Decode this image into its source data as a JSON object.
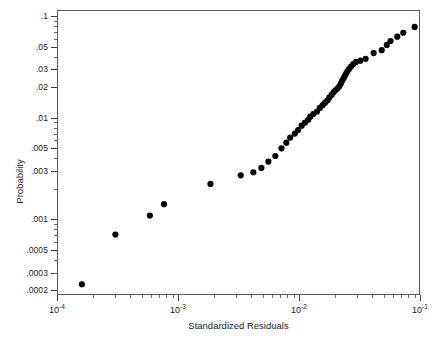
{
  "chart_data": {
    "type": "scatter",
    "title": "",
    "xlabel": "Standardized Residuals",
    "ylabel": "Probability",
    "xscale": "log",
    "yscale": "log",
    "xlim": [
      0.0001,
      0.1
    ],
    "ylim": [
      0.00018,
      0.115
    ],
    "grid": false,
    "legend": null,
    "marker": "filled-circle",
    "marker_color": "#000000",
    "x_tick_labels": [
      "10-4",
      "10-3",
      "10-2",
      "10-1"
    ],
    "x_tick_values": [
      0.0001,
      0.001,
      0.01,
      0.1
    ],
    "y_tick_labels": [
      ".1",
      ".05",
      ".03",
      ".02",
      ".01",
      ".005",
      ".003",
      ".001",
      ".0005",
      ".0003",
      ".0002"
    ],
    "y_tick_values": [
      0.1,
      0.05,
      0.03,
      0.02,
      0.01,
      0.005,
      0.003,
      0.001,
      0.0005,
      0.0003,
      0.0002
    ],
    "n_points": 50,
    "points": [
      [
        0.000158,
        0.000225
      ],
      [
        0.0003,
        0.0007
      ],
      [
        0.00058,
        0.00108
      ],
      [
        0.00076,
        0.0014
      ],
      [
        0.00185,
        0.00222
      ],
      [
        0.0033,
        0.0027
      ],
      [
        0.0042,
        0.0029
      ],
      [
        0.0049,
        0.0032
      ],
      [
        0.0056,
        0.0037
      ],
      [
        0.0064,
        0.0042
      ],
      [
        0.0072,
        0.005
      ],
      [
        0.0079,
        0.0057
      ],
      [
        0.0085,
        0.0064
      ],
      [
        0.0093,
        0.007
      ],
      [
        0.0099,
        0.0076
      ],
      [
        0.0106,
        0.0084
      ],
      [
        0.0113,
        0.009
      ],
      [
        0.012,
        0.0096
      ],
      [
        0.0125,
        0.0103
      ],
      [
        0.0133,
        0.011
      ],
      [
        0.0142,
        0.0116
      ],
      [
        0.015,
        0.0126
      ],
      [
        0.0158,
        0.0134
      ],
      [
        0.0166,
        0.0142
      ],
      [
        0.0174,
        0.015
      ],
      [
        0.018,
        0.016
      ],
      [
        0.0188,
        0.017
      ],
      [
        0.0195,
        0.018
      ],
      [
        0.0202,
        0.0188
      ],
      [
        0.021,
        0.0196
      ],
      [
        0.0218,
        0.0206
      ],
      [
        0.0224,
        0.022
      ],
      [
        0.023,
        0.0234
      ],
      [
        0.0236,
        0.0248
      ],
      [
        0.0242,
        0.0262
      ],
      [
        0.0248,
        0.0276
      ],
      [
        0.0254,
        0.029
      ],
      [
        0.0262,
        0.0306
      ],
      [
        0.0272,
        0.0324
      ],
      [
        0.0284,
        0.0342
      ],
      [
        0.03,
        0.036
      ],
      [
        0.0326,
        0.037
      ],
      [
        0.036,
        0.0386
      ],
      [
        0.042,
        0.044
      ],
      [
        0.049,
        0.047
      ],
      [
        0.054,
        0.053
      ],
      [
        0.058,
        0.058
      ],
      [
        0.066,
        0.064
      ],
      [
        0.074,
        0.07
      ],
      [
        0.092,
        0.08
      ]
    ]
  },
  "axis": {
    "y_title": "Probability",
    "x_title": "Standardized Residuals",
    "x_labels": [
      {
        "mantissa": "10",
        "exp": "-4"
      },
      {
        "mantissa": "10",
        "exp": "-3"
      },
      {
        "mantissa": "10",
        "exp": "-2"
      },
      {
        "mantissa": "10",
        "exp": "-1"
      }
    ]
  },
  "colors": {
    "marker": "#000000",
    "frame": "#5d5d5d",
    "text": "#1a1a1a",
    "background": "#ffffff"
  }
}
